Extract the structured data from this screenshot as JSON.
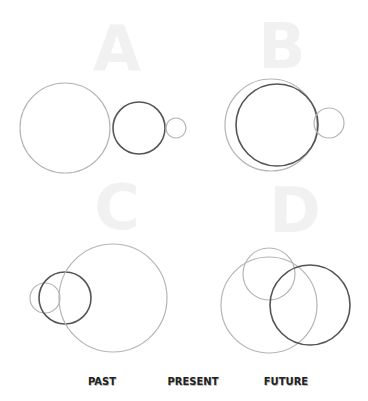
{
  "colors": {
    "background": "#ffffff",
    "past": "#b5b5b5",
    "present": "#555555",
    "future": "#b5b5b5",
    "letter": "#f1f1f1",
    "legend_text": "#222222"
  },
  "panels": [
    {
      "label": "A",
      "letter_pos": [
        117,
        70
      ],
      "circles": [
        {
          "role": "past",
          "cx": 65,
          "cy": 128,
          "r": 45
        },
        {
          "role": "present",
          "cx": 139,
          "cy": 128,
          "r": 26
        },
        {
          "role": "future",
          "cx": 176,
          "cy": 128,
          "r": 10
        }
      ]
    },
    {
      "label": "B",
      "letter_pos": [
        282,
        68
      ],
      "circles": [
        {
          "role": "past",
          "cx": 271,
          "cy": 125,
          "r": 46
        },
        {
          "role": "present",
          "cx": 277,
          "cy": 125,
          "r": 41
        },
        {
          "role": "future",
          "cx": 329,
          "cy": 123,
          "r": 15
        }
      ]
    },
    {
      "label": "C",
      "letter_pos": [
        117,
        229
      ],
      "circles": [
        {
          "role": "past",
          "cx": 45,
          "cy": 298,
          "r": 15
        },
        {
          "role": "present",
          "cx": 65,
          "cy": 298,
          "r": 26
        },
        {
          "role": "future",
          "cx": 113,
          "cy": 298,
          "r": 54
        }
      ]
    },
    {
      "label": "D",
      "letter_pos": [
        295,
        232
      ],
      "circles": [
        {
          "role": "past",
          "cx": 269,
          "cy": 305,
          "r": 48
        },
        {
          "role": "future",
          "cx": 269,
          "cy": 274,
          "r": 26
        },
        {
          "role": "present",
          "cx": 310,
          "cy": 305,
          "r": 40
        }
      ]
    }
  ],
  "legend": {
    "items": [
      {
        "label": "PAST",
        "x": 102
      },
      {
        "label": "PRESENT",
        "x": 193
      },
      {
        "label": "FUTURE",
        "x": 286
      }
    ],
    "y": 385
  }
}
